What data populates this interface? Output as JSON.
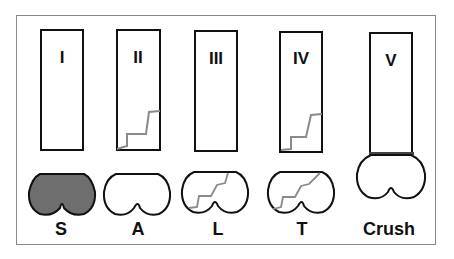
{
  "figure": {
    "type_numerals": [
      "I",
      "II",
      "III",
      "IV",
      "V"
    ],
    "fracture_labels": [
      "S",
      "A",
      "L",
      "T",
      "Crush"
    ],
    "colors": {
      "outline": "#111111",
      "fracture_line": "#8a8a8a",
      "split_fill": "#6e6e6e",
      "frame": "#8a8a8a",
      "crush_band": "#444444"
    }
  }
}
